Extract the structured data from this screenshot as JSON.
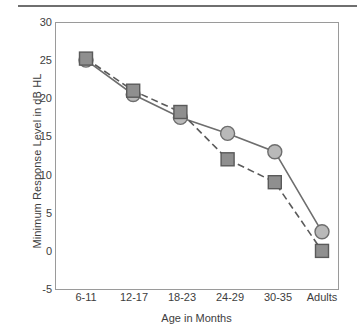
{
  "chart_data": {
    "type": "line",
    "title": "",
    "xlabel": "Age in Months",
    "ylabel": "Minimum Response Level in dB HL",
    "categories": [
      "6-11",
      "12-17",
      "18-23",
      "24-29",
      "30-35",
      "Adults"
    ],
    "ylim": [
      -5,
      30
    ],
    "yticks": [
      "30",
      "25",
      "20",
      "15",
      "10",
      "5",
      "0",
      "-5"
    ],
    "ytick_values": [
      30,
      25,
      20,
      15,
      10,
      5,
      0,
      -5
    ],
    "grid": false,
    "legend": "none",
    "series": [
      {
        "name": "circle-series",
        "marker": "circle",
        "line_style": "solid",
        "color": "#b9b9b9",
        "edge_color": "#6e6e6e",
        "values": [
          25.0,
          20.5,
          17.5,
          15.4,
          13.0,
          2.5
        ]
      },
      {
        "name": "square-series",
        "marker": "square",
        "line_style": "dashed",
        "color": "#8f8f8f",
        "edge_color": "#5a5a5a",
        "values": [
          25.2,
          21.0,
          18.2,
          12.0,
          9.0,
          0.0
        ]
      }
    ],
    "axis_color": "#9a9a9a",
    "text_color": "#3d3d3d"
  }
}
